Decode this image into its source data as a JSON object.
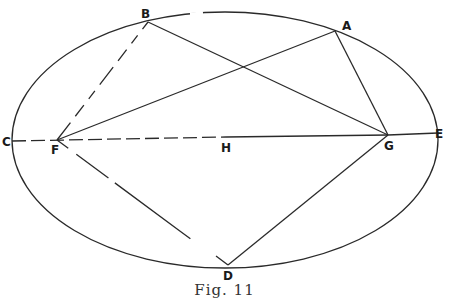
{
  "figure": {
    "caption": "Fig. 11",
    "ellipse": {
      "cx": 225,
      "cy": 140,
      "rx": 213,
      "ry": 128
    },
    "points": {
      "A": {
        "label": "A",
        "x": 335,
        "y": 31
      },
      "B": {
        "label": "B",
        "x": 148,
        "y": 22
      },
      "C": {
        "label": "C",
        "x": 12,
        "y": 141
      },
      "D": {
        "label": "D",
        "x": 228,
        "y": 265
      },
      "E": {
        "label": "E",
        "x": 438,
        "y": 133
      },
      "F": {
        "label": "F",
        "x": 57,
        "y": 140
      },
      "G": {
        "label": "G",
        "x": 388,
        "y": 135
      },
      "H": {
        "label": "H",
        "x": 226,
        "y": 137
      }
    },
    "segments": [
      {
        "from": "F",
        "to": "B",
        "style": "dashed"
      },
      {
        "from": "F",
        "to": "A",
        "style": "solid"
      },
      {
        "from": "B",
        "to": "G",
        "style": "solid"
      },
      {
        "from": "A",
        "to": "G",
        "style": "solid"
      },
      {
        "from": "C",
        "to": "G",
        "style": "dashed"
      },
      {
        "from": "G",
        "to": "E",
        "style": "solid"
      },
      {
        "from": "F",
        "to": "D",
        "style": "dashed"
      },
      {
        "from": "G",
        "to": "D",
        "style": "solid"
      }
    ],
    "colors": {
      "stroke": "#2a2a2a",
      "background": "#ffffff"
    }
  }
}
